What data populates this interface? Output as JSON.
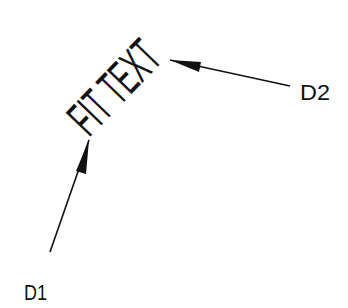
{
  "diagram": {
    "fit_text": "FIT TEXT",
    "point1_label": "D1",
    "point2_label": "D2",
    "stroke_color": "#111111",
    "background": "#ffffff"
  }
}
